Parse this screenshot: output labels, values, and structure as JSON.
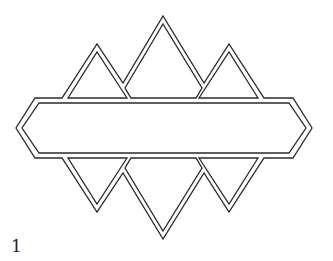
{
  "figure": {
    "label": "1",
    "stroke_color": "#2a2a2a",
    "background": "#ffffff"
  }
}
